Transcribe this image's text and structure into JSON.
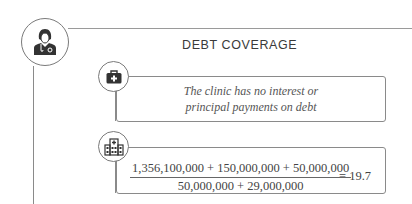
{
  "title": "DEBT COVERAGE",
  "icons": {
    "main": "doctor-icon",
    "item1": "briefcase-medical-icon",
    "item2": "hospital-icon"
  },
  "items": [
    {
      "text_line1": "The clinic has no interest or",
      "text_line2": "principal payments on debt"
    },
    {
      "numerator": "1,356,100,000 + 150,000,000 + 50,000,000",
      "denominator": "50,000,000 + 29,000,000",
      "result": "= 19.7"
    }
  ],
  "colors": {
    "line": "#8a8a8a",
    "icon": "#3a3a3a",
    "text": "#444444"
  }
}
